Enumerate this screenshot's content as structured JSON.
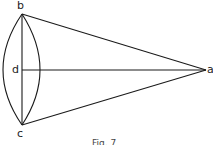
{
  "diagram": {
    "labels": {
      "b": "b",
      "c": "c",
      "d": "d",
      "apex": "a"
    },
    "caption": "Fig. 7",
    "stroke_color": "#1a1a1a",
    "points": {
      "b": [
        22,
        14
      ],
      "c": [
        22,
        125
      ],
      "d": [
        22,
        70
      ],
      "apex": [
        206,
        70
      ]
    }
  }
}
